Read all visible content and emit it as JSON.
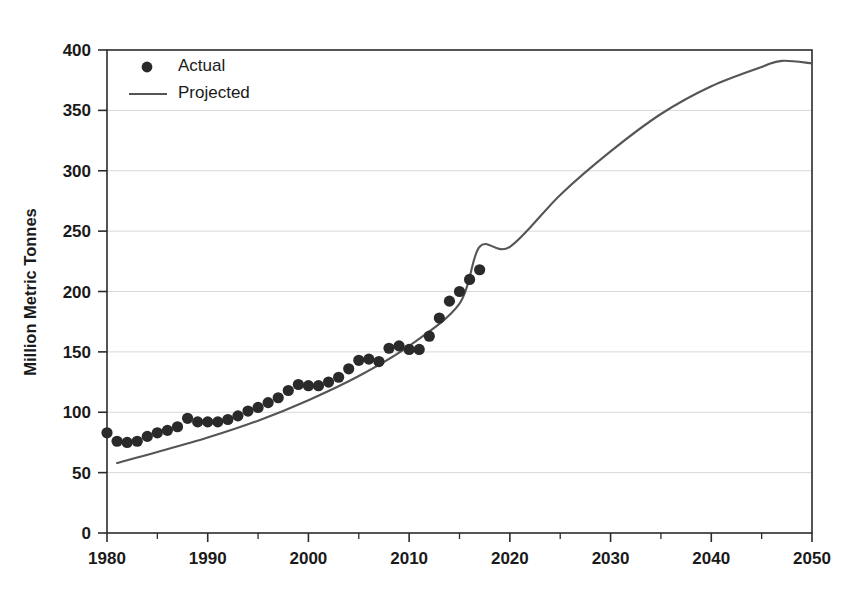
{
  "chart_data": {
    "type": "scatter",
    "title": "",
    "xlabel": "",
    "ylabel": "Million Metric Tonnes",
    "xlim": [
      1980,
      2050
    ],
    "ylim": [
      0,
      400
    ],
    "x_ticks": [
      1980,
      1990,
      2000,
      2010,
      2020,
      2030,
      2040,
      2050
    ],
    "x_minor_ticks": [
      1985,
      1995,
      2005,
      2015,
      2025,
      2035,
      2045
    ],
    "y_ticks": [
      0,
      50,
      100,
      150,
      200,
      250,
      300,
      350,
      400
    ],
    "grid": "horizontal",
    "legend_position": "top-left",
    "series": [
      {
        "name": "Actual",
        "type": "scatter",
        "marker": "circle",
        "color": "#2a2a2a",
        "x": [
          1980,
          1981,
          1982,
          1983,
          1984,
          1985,
          1986,
          1987,
          1988,
          1989,
          1990,
          1991,
          1992,
          1993,
          1994,
          1995,
          1996,
          1997,
          1998,
          1999,
          2000,
          2001,
          2002,
          2003,
          2004,
          2005,
          2006,
          2007,
          2008,
          2009,
          2010,
          2011,
          2012,
          2013,
          2014,
          2015,
          2016,
          2017
        ],
        "values": [
          83,
          76,
          75,
          76,
          80,
          83,
          85,
          88,
          95,
          92,
          92,
          92,
          94,
          97,
          101,
          104,
          108,
          112,
          118,
          123,
          122,
          122,
          125,
          129,
          136,
          143,
          144,
          142,
          153,
          155,
          152,
          152,
          163,
          178,
          192,
          200,
          210,
          218
        ]
      },
      {
        "name": "Projected",
        "type": "line",
        "color": "#555555",
        "x": [
          1981,
          1985,
          1990,
          1995,
          2000,
          2005,
          2010,
          2015,
          2017,
          2020,
          2025,
          2030,
          2035,
          2040,
          2045,
          2047,
          2050
        ],
        "values": [
          58,
          67,
          79,
          93,
          110,
          130,
          155,
          190,
          237,
          237,
          280,
          316,
          347,
          370,
          386,
          391,
          389
        ]
      }
    ],
    "notes": {
      "actual_last_year": 2017,
      "actual_last_value": 237,
      "projected_peak_year": 2047,
      "projected_peak_value": 391,
      "projected_end_value": 389
    }
  },
  "legend": {
    "items": [
      {
        "label": "Actual",
        "marker": "dot",
        "color": "#2a2a2a"
      },
      {
        "label": "Projected",
        "marker": "line",
        "color": "#555555"
      }
    ]
  },
  "axes": {
    "y_title": "Million Metric Tonnes",
    "y_tick_labels": [
      "0",
      "50",
      "100",
      "150",
      "200",
      "250",
      "300",
      "350",
      "400"
    ],
    "x_tick_labels": [
      "1980",
      "1990",
      "2000",
      "2010",
      "2020",
      "2030",
      "2040",
      "2050"
    ]
  }
}
